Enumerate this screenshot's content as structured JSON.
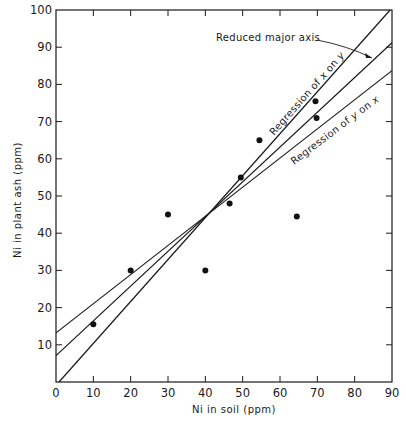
{
  "chart_data": {
    "type": "scatter",
    "title": "",
    "xlabel": "Ni in soil (ppm)",
    "ylabel": "Ni in plant ash (ppm)",
    "xlim": [
      0,
      90
    ],
    "ylim": [
      0,
      100
    ],
    "xticks": [
      0,
      10,
      20,
      30,
      40,
      50,
      60,
      70,
      80,
      90
    ],
    "yticks": [
      10,
      20,
      30,
      40,
      50,
      60,
      70,
      80,
      90,
      100
    ],
    "xtick_labels": [
      "0",
      "10",
      "20",
      "30",
      "40",
      "50",
      "60",
      "70",
      "80",
      "90"
    ],
    "ytick_labels": [
      "10",
      "20",
      "30",
      "40",
      "50",
      "60",
      "70",
      "80",
      "90",
      "100"
    ],
    "grid": false,
    "points": [
      {
        "x": 10,
        "y": 15.5
      },
      {
        "x": 20,
        "y": 30
      },
      {
        "x": 30,
        "y": 45
      },
      {
        "x": 40,
        "y": 30
      },
      {
        "x": 46.5,
        "y": 48
      },
      {
        "x": 49.5,
        "y": 55
      },
      {
        "x": 54.5,
        "y": 65
      },
      {
        "x": 64.5,
        "y": 44.5
      },
      {
        "x": 69.5,
        "y": 75.5
      },
      {
        "x": 69.8,
        "y": 71
      }
    ],
    "lines": [
      {
        "name": "Regression of x on y",
        "label_prefix": "Regression of ",
        "label_var1": "x",
        "label_mid": " on ",
        "label_var2": "y",
        "x": [
          0.8,
          89.5
        ],
        "y": [
          0,
          100
        ]
      },
      {
        "name": "Reduced major axis",
        "x": [
          0,
          90
        ],
        "y": [
          7.1,
          91.2
        ]
      },
      {
        "name": "Regression of y on x",
        "label_prefix": "Regression of ",
        "label_var1": "y",
        "label_mid": " on ",
        "label_var2": "x",
        "x": [
          0,
          90
        ],
        "y": [
          13.2,
          83.7
        ]
      }
    ],
    "annotations": [
      {
        "text": "Reduced major axis",
        "target": "Reduced major axis"
      }
    ]
  }
}
